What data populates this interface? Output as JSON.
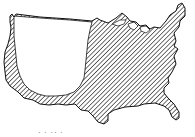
{
  "map": {
    "subject": "United States outline",
    "style": "black and white line drawing with diagonal hatching",
    "regions": [
      {
        "name": "western-interior",
        "fill": "unshaded",
        "color": "#ffffff"
      },
      {
        "name": "remaining-states",
        "fill": "diagonal-hatch",
        "color": "#222222"
      }
    ],
    "outline_color": "#111111"
  },
  "caption": {
    "text": "· ·  ·· ·"
  }
}
